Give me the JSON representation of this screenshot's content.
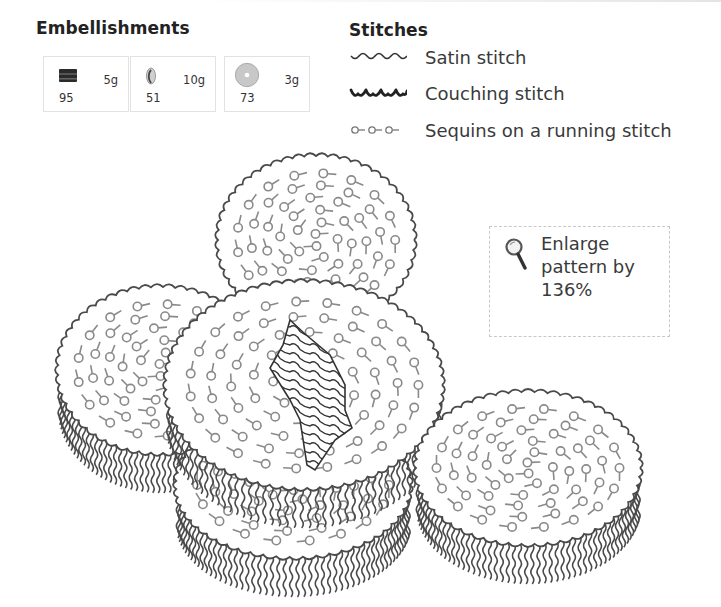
{
  "embellishments": {
    "title": "Embellishments",
    "items": [
      {
        "name": "bugle-bead",
        "icon": "bugle-bead-icon",
        "weight": "5g",
        "count": "95",
        "x": 43
      },
      {
        "name": "drop-bead",
        "icon": "drop-bead-icon",
        "weight": "10g",
        "count": "51",
        "x": 130
      },
      {
        "name": "sequin",
        "icon": "sequin-icon",
        "weight": "3g",
        "count": "73",
        "x": 224
      }
    ]
  },
  "stitches": {
    "title": "Stitches",
    "items": [
      {
        "name": "satin-stitch",
        "icon": "satin-stitch-icon",
        "label": "Satin stitch",
        "y": 46
      },
      {
        "name": "couching-stitch",
        "icon": "couching-stitch-icon",
        "label": "Couching stitch",
        "y": 82
      },
      {
        "name": "sequins-running-stitch",
        "icon": "sequin-running-stitch-icon",
        "label": "Sequins on a running stitch",
        "y": 119
      }
    ]
  },
  "enlarge_note": {
    "icon": "magnifier-icon",
    "line1": "Enlarge",
    "line2": "pattern by",
    "line3": "136%"
  },
  "colors": {
    "outline": "#4a4a4a",
    "sequin": "#8a8a8a",
    "text": "#3a3a3a"
  },
  "pattern": {
    "disks": [
      {
        "id": "top-disk",
        "cx": 316,
        "cy": 240,
        "rx": 98,
        "ry": 84,
        "fringe": false,
        "order": 1
      },
      {
        "id": "left-disk",
        "cx": 160,
        "cy": 370,
        "rx": 102,
        "ry": 83,
        "fringe": true,
        "order": 2
      },
      {
        "id": "bottom-disk",
        "cx": 293,
        "cy": 485,
        "rx": 117,
        "ry": 72,
        "fringe": true,
        "order": 3
      },
      {
        "id": "center-disk",
        "cx": 304,
        "cy": 385,
        "rx": 138,
        "ry": 103,
        "fringe": true,
        "order": 4
      },
      {
        "id": "right-disk",
        "cx": 528,
        "cy": 468,
        "rx": 112,
        "ry": 76,
        "fringe": true,
        "order": 5
      }
    ],
    "satin_patch": {
      "points": "290,320 305,334 330,355 345,385 345,410 352,428 335,440 315,470 307,465 300,420 290,400 270,368 283,345"
    }
  }
}
